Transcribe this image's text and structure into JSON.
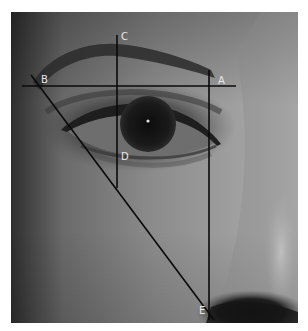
{
  "figure": {
    "labels": {
      "A": "A",
      "B": "B",
      "C": "C",
      "D": "D",
      "E": "E"
    },
    "caption_visible_fragment": "",
    "colors": {
      "background": "#ffffff",
      "line": "#0a0a0a",
      "label": "#e8e8e8",
      "skin_light": "#9a9a9a",
      "skin_dark": "#3a3a3a",
      "iris": "#141414"
    }
  }
}
